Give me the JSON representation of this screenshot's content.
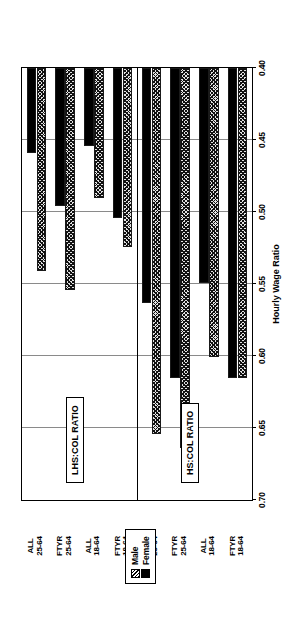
{
  "chart_data": {
    "type": "bar",
    "orientation": "horizontal",
    "title": "",
    "xlabel": "Hourly Wage Ratio",
    "ylabel": "",
    "xlim": [
      0.7,
      0.4
    ],
    "axis_direction": "descending",
    "tick_labels": [
      "0.70",
      "0.65",
      "0.60",
      "0.55",
      "0.50",
      "0.45",
      "0.40"
    ],
    "tick_values": [
      0.7,
      0.65,
      0.6,
      0.55,
      0.5,
      0.45,
      0.4
    ],
    "grid": true,
    "legend_position": "top-left",
    "legend": [
      "Male",
      "Female"
    ],
    "panels": [
      {
        "name": "HS:COL RATIO",
        "categories": [
          "FTYR 18-64",
          "ALL 18-64",
          "FTYR 25-64",
          "ALL 25-64"
        ],
        "series": [
          {
            "name": "Male",
            "values": [
              0.615,
              0.601,
              0.664,
              0.654
            ]
          },
          {
            "name": "Female",
            "values": [
              0.615,
              0.549,
              0.615,
              0.563
            ]
          }
        ]
      },
      {
        "name": "LHS:COL RATIO",
        "categories": [
          "FTYR 18-64",
          "ALL 18-64",
          "FTYR 25-64",
          "ALL 25-64"
        ],
        "series": [
          {
            "name": "Male",
            "values": [
              0.524,
              0.49,
              0.554,
              0.541
            ]
          },
          {
            "name": "Female",
            "values": [
              0.504,
              0.454,
              0.496,
              0.459
            ]
          }
        ]
      }
    ],
    "series_styles": [
      {
        "name": "Male",
        "fill": "hatched",
        "color": "#000000"
      },
      {
        "name": "Female",
        "fill": "solid",
        "color": "#000000"
      }
    ]
  },
  "legend": {
    "male_label": "Male",
    "female_label": "Female"
  },
  "panels": {
    "lhs_col": "LHS:COL RATIO",
    "hs_col": "HS:COL RATIO"
  },
  "categories": {
    "hs_ftyr_18_64_line1": "FTYR",
    "hs_ftyr_18_64_line2": "18-64",
    "hs_all_18_64_line1": "ALL",
    "hs_all_18_64_line2": "18-64",
    "hs_ftyr_25_64_line1": "FTYR",
    "hs_ftyr_25_64_line2": "25-64",
    "hs_all_25_64_line1": "ALL",
    "hs_all_25_64_line2": "25-64",
    "lhs_ftyr_18_64_line1": "FTYR",
    "lhs_ftyr_18_64_line2": "18-64",
    "lhs_all_18_64_line1": "ALL",
    "lhs_all_18_64_line2": "18-64",
    "lhs_ftyr_25_64_line1": "FTYR",
    "lhs_ftyr_25_64_line2": "25-64",
    "lhs_all_25_64_line1": "ALL",
    "lhs_all_25_64_line2": "25-64"
  },
  "axis": {
    "title": "Hourly Wage Ratio",
    "t0": "0.70",
    "t1": "0.65",
    "t2": "0.60",
    "t3": "0.55",
    "t4": "0.50",
    "t5": "0.45",
    "t6": "0.40"
  }
}
